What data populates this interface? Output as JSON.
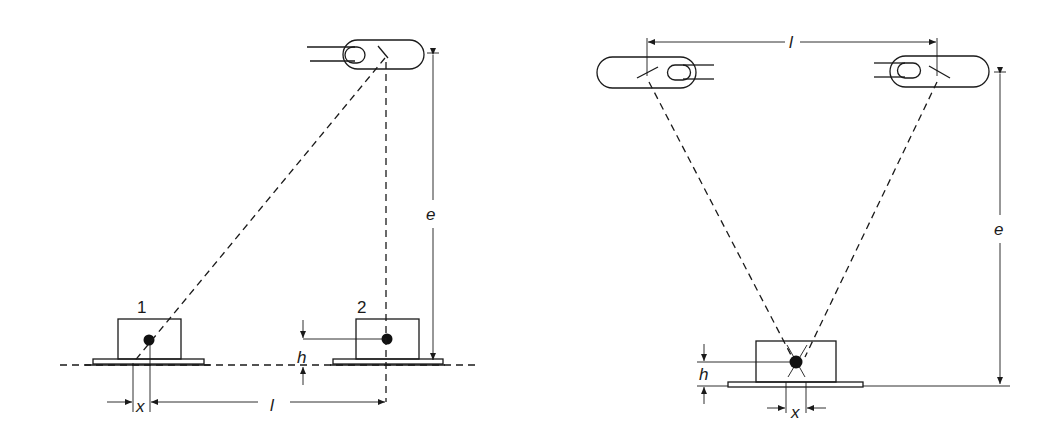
{
  "left_diagram": {
    "object1_label": "1",
    "object2_label": "2",
    "dim_x": "x",
    "dim_l": "l",
    "dim_h": "h",
    "dim_e": "e"
  },
  "right_diagram": {
    "dim_l": "l",
    "dim_e": "e",
    "dim_h": "h",
    "dim_x": "x"
  },
  "colors": {
    "line": "#1a1a1a",
    "background": "#ffffff"
  }
}
